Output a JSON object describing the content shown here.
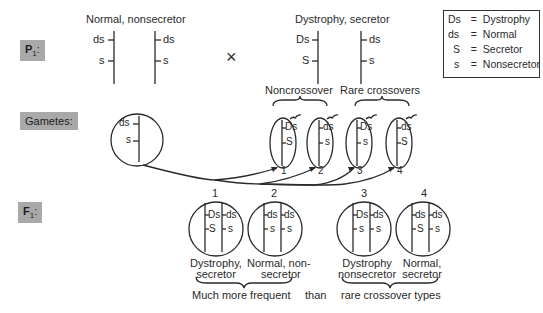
{
  "rows": {
    "p1_label": "P",
    "p1_sub": "1",
    "gametes_label": "Gametes:",
    "f1_label": "F",
    "f1_sub": "1"
  },
  "parents": {
    "left": {
      "title": "Normal, nonsecretor",
      "chrom_a": [
        "ds",
        "s"
      ],
      "chrom_b": [
        "ds",
        "s"
      ]
    },
    "cross_symbol": "×",
    "right": {
      "title": "Dystrophy, secretor",
      "chrom_a": [
        "Ds",
        "S"
      ],
      "chrom_b": [
        "ds",
        "s"
      ]
    }
  },
  "legend": [
    {
      "symbol": "Ds",
      "eq": "=",
      "meaning": "Dystrophy"
    },
    {
      "symbol": "ds",
      "eq": "=",
      "meaning": "Normal"
    },
    {
      "symbol": "S",
      "eq": "=",
      "meaning": "Secretor"
    },
    {
      "symbol": "s",
      "eq": "=",
      "meaning": "Nonsecretor"
    }
  ],
  "gametes": {
    "left_gamete": [
      "ds",
      "s"
    ],
    "group_labels": [
      "Noncrossover",
      "Rare crossovers"
    ],
    "right_gametes": [
      {
        "number": "1",
        "alleles": [
          "Ds",
          "S"
        ]
      },
      {
        "number": "2",
        "alleles": [
          "ds",
          "s"
        ]
      },
      {
        "number": "3",
        "alleles": [
          "Ds",
          "s"
        ]
      },
      {
        "number": "4",
        "alleles": [
          "ds",
          "S"
        ]
      }
    ]
  },
  "offspring": [
    {
      "number": "1",
      "chrom_a": [
        "Ds",
        "S"
      ],
      "chrom_b": [
        "ds",
        "s"
      ],
      "phenotype_line1": "Dystrophy,",
      "phenotype_line2": "secretor"
    },
    {
      "number": "2",
      "chrom_a": [
        "ds",
        "s"
      ],
      "chrom_b": [
        "ds",
        "s"
      ],
      "phenotype_line1": "Normal, non-",
      "phenotype_line2": "secretor"
    },
    {
      "number": "3",
      "chrom_a": [
        "Ds",
        "s"
      ],
      "chrom_b": [
        "ds",
        "s"
      ],
      "phenotype_line1": "Dystrophy",
      "phenotype_line2": "nonsecretor"
    },
    {
      "number": "4",
      "chrom_a": [
        "ds",
        "S"
      ],
      "chrom_b": [
        "ds",
        "s"
      ],
      "phenotype_line1": "Normal,",
      "phenotype_line2": "secretor"
    }
  ],
  "footer": {
    "frequent": "Much more frequent",
    "than": "than",
    "rare": "rare crossover types"
  }
}
